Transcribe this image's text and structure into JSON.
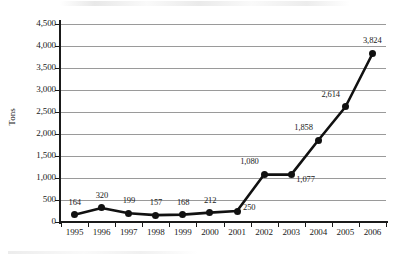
{
  "chart_data": {
    "type": "line",
    "title": "",
    "xlabel": "",
    "ylabel": "Tons",
    "categories": [
      "1995",
      "1996",
      "1997",
      "1998",
      "1999",
      "2000",
      "2001",
      "2002",
      "2003",
      "2004",
      "2005",
      "2006"
    ],
    "values": [
      164,
      320,
      199,
      157,
      168,
      212,
      250,
      1080,
      1077,
      1858,
      2614,
      3824
    ],
    "point_labels": [
      "164",
      "320",
      "199",
      "157",
      "168",
      "212",
      "250",
      "1,080",
      "1,077",
      "1,858",
      "2,614",
      "3,824"
    ],
    "series": [
      {
        "name": "Tons",
        "values": [
          164,
          320,
          199,
          157,
          168,
          212,
          250,
          1080,
          1077,
          1858,
          2614,
          3824
        ]
      }
    ],
    "ylim": [
      0,
      4500
    ],
    "y_ticks": [
      0,
      500,
      1000,
      1500,
      2000,
      2500,
      3000,
      3500,
      4000,
      4500
    ],
    "y_tick_labels": [
      "0",
      "500",
      "1,000",
      "1,500",
      "2,000",
      "2,500",
      "3,000",
      "3,500",
      "4,000",
      "4,500"
    ],
    "grid": true,
    "grid_axis": "y",
    "legend": false,
    "legend_position": "none",
    "line_color": "#111111",
    "marker_color": "#111111",
    "grid_color": "#9a9a9a",
    "axis_color": "#1a1a1a"
  }
}
